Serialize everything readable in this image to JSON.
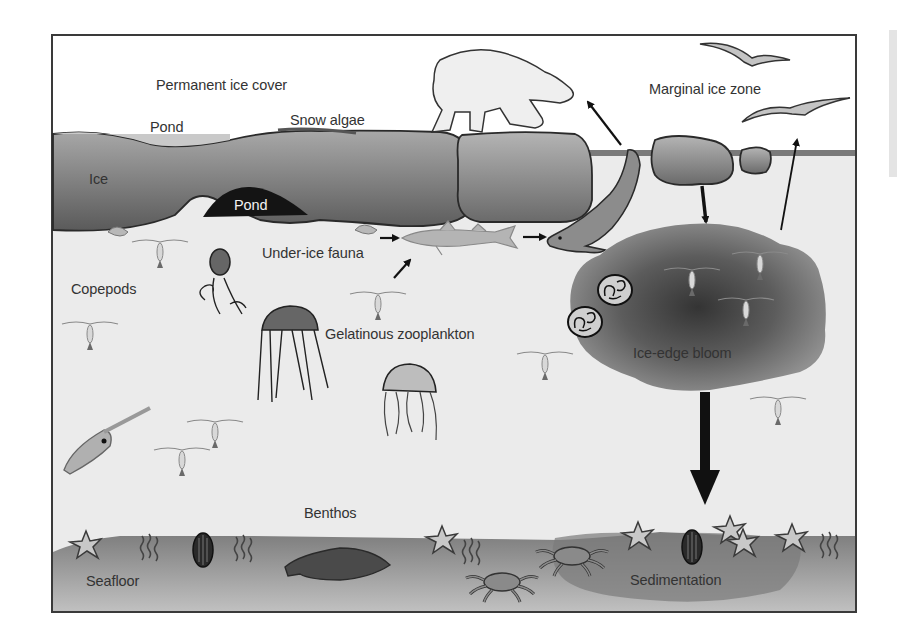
{
  "diagram": {
    "colors": {
      "frame": "#3a3a3a",
      "sky": "#ffffff",
      "water": "#ececec",
      "ice_top": "#9a9a9a",
      "ice_bottom": "#5e5e5e",
      "pond_dark": "#111111",
      "bloom_outer": "#8a8a8a",
      "bloom_core": "#3d3d3d",
      "seafloor_top": "#7a7a7a",
      "seafloor_bottom": "#b8b8b8",
      "arrow": "#111111"
    },
    "labels": {
      "permanent_ice_cover": "Permanent ice cover",
      "pond_surface": "Pond",
      "snow_algae": "Snow algae",
      "ice": "Ice",
      "pond_under": "Pond",
      "marginal_ice_zone": "Marginal ice zone",
      "under_ice_fauna": "Under-ice fauna",
      "copepods": "Copepods",
      "gelatinous_zooplankton": "Gelatinous zooplankton",
      "ice_edge_bloom": "Ice-edge bloom",
      "benthos": "Benthos",
      "seafloor": "Seafloor",
      "sedimentation": "Sedimentation"
    },
    "organisms": [
      "polar bear",
      "seabirds",
      "seal",
      "arctic cod",
      "amphipods",
      "copepods",
      "ctenophore",
      "jellyfish",
      "squid",
      "diatoms",
      "starfish",
      "bivalves",
      "polychaete worms",
      "flatfish",
      "crabs"
    ],
    "flows": [
      {
        "from": "amphipods",
        "to": "arctic cod"
      },
      {
        "from": "copepods",
        "to": "arctic cod"
      },
      {
        "from": "arctic cod",
        "to": "seal"
      },
      {
        "from": "seal",
        "to": "polar bear"
      },
      {
        "from": "ice floe",
        "to": "ice-edge bloom"
      },
      {
        "from": "ice-edge bloom",
        "to": "seabirds"
      },
      {
        "from": "ice-edge bloom",
        "to": "sedimentation"
      }
    ]
  }
}
